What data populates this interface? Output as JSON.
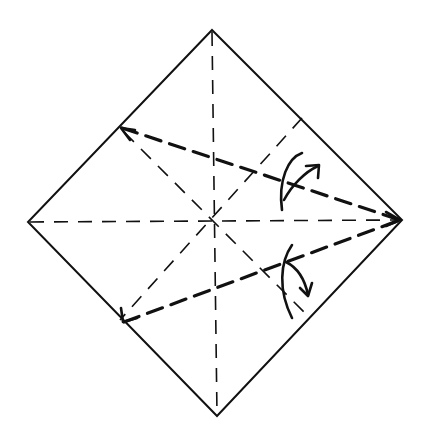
{
  "diagram": {
    "type": "origami-fold-instruction",
    "description": "Square paper in diamond orientation with crease lines; the upper-left and lower-left edges are folded to meet at the right corner along bold valley-fold lines",
    "colors": {
      "ink": "#111111",
      "paper": "#ffffff"
    },
    "vertices": {
      "top": [
        212,
        30
      ],
      "left": [
        28,
        222
      ],
      "right": [
        402,
        220
      ],
      "bottom": [
        217,
        416
      ],
      "center": [
        213,
        222
      ]
    },
    "creases": {
      "vertical_center": "dashed thin",
      "horizontal_center": "dashed thin",
      "diagonal_1": "dashed thin from upper-left edge through center to lower-right edge",
      "diagonal_2": "dashed thin from upper-right edge through center to lower-left edge"
    },
    "folds": [
      {
        "name": "upper-fold",
        "from": [
          121,
          128
        ],
        "to": [
          400,
          220
        ],
        "style": "bold valley fold",
        "arrow": "curved arrow, up-right"
      },
      {
        "name": "lower-fold",
        "from": [
          123,
          322
        ],
        "to": [
          400,
          220
        ],
        "style": "bold valley fold",
        "arrow": "curved arrow, down-right"
      }
    ]
  }
}
